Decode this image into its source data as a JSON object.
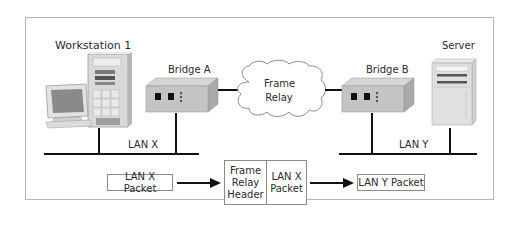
{
  "diagram": {
    "type": "network-diagram",
    "nodes": {
      "workstation": {
        "label": "Workstation 1",
        "icon": "desktop-computer-icon"
      },
      "bridge_a": {
        "label": "Bridge A",
        "icon": "bridge-device-icon"
      },
      "frame_relay": {
        "line1": "Frame",
        "line2": "Relay",
        "icon": "cloud-icon"
      },
      "bridge_b": {
        "label": "Bridge B",
        "icon": "bridge-device-icon"
      },
      "server": {
        "label": "Server",
        "icon": "server-tower-icon"
      }
    },
    "networks": {
      "lan_x": {
        "label": "LAN X"
      },
      "lan_y": {
        "label": "LAN Y"
      }
    },
    "packet_flow": {
      "input_packet": "LAN X Packet",
      "encapsulated": {
        "header_line1": "Frame",
        "header_line2": "Relay",
        "header_line3": "Header",
        "payload_line1": "LAN X",
        "payload_line2": "Packet"
      },
      "output_packet": "LAN Y Packet"
    },
    "colors": {
      "line": "#111111",
      "device_body": "#bdbdbd",
      "border": "#8a8a8a"
    }
  }
}
